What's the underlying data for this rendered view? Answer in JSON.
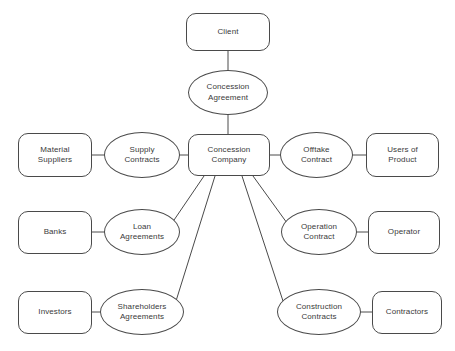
{
  "diagram": {
    "background_color": "#ffffff",
    "stroke_color": "#4a4a4a",
    "text_color": "#3a3a3a",
    "nodes": {
      "client": "Client",
      "concession_agreement": "Concession\nAgreement",
      "concession_company": "Concession\nCompany",
      "material_suppliers": "Material\nSuppliers",
      "supply_contracts": "Supply\nContracts",
      "offtake_contract": "Offtake\nContract",
      "users_of_product": "Users of\nProduct",
      "banks": "Banks",
      "loan_agreements": "Loan\nAgreements",
      "operation_contract": "Operation\nContract",
      "operator": "Operator",
      "investors": "Investors",
      "shareholders_agreements": "Shareholders\nAgreements",
      "construction_contracts": "Construction\nContracts",
      "contractors": "Contractors"
    },
    "edges": [
      {
        "from": "client",
        "to": "concession_agreement"
      },
      {
        "from": "concession_agreement",
        "to": "concession_company"
      },
      {
        "from": "material_suppliers",
        "to": "supply_contracts"
      },
      {
        "from": "supply_contracts",
        "to": "concession_company"
      },
      {
        "from": "concession_company",
        "to": "offtake_contract"
      },
      {
        "from": "offtake_contract",
        "to": "users_of_product"
      },
      {
        "from": "banks",
        "to": "loan_agreements"
      },
      {
        "from": "loan_agreements",
        "to": "concession_company"
      },
      {
        "from": "concession_company",
        "to": "operation_contract"
      },
      {
        "from": "operation_contract",
        "to": "operator"
      },
      {
        "from": "investors",
        "to": "shareholders_agreements"
      },
      {
        "from": "shareholders_agreements",
        "to": "concession_company"
      },
      {
        "from": "concession_company",
        "to": "construction_contracts"
      },
      {
        "from": "construction_contracts",
        "to": "contractors"
      }
    ]
  }
}
